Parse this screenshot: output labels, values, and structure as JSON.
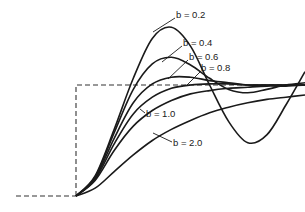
{
  "chart_data": {
    "type": "line",
    "title": "",
    "subtitle": "Unit step response of a second-order system for various damping ratios b",
    "xlabel": "",
    "ylabel": "",
    "grid": false,
    "legend_position": "inline leader-line labels",
    "input": {
      "name": "unit step",
      "style": "dashed",
      "baseline": 0,
      "level": 1.0
    },
    "x": [
      0,
      1,
      2,
      3,
      4,
      5,
      6,
      7,
      8,
      9,
      10,
      11,
      12
    ],
    "series": [
      {
        "name": "b = 0.2",
        "label": "b = 0.2",
        "values": [
          0,
          0.18,
          0.6,
          1.06,
          1.42,
          1.52,
          1.35,
          1.0,
          0.67,
          0.48,
          0.55,
          0.82,
          1.12
        ]
      },
      {
        "name": "b = 0.4",
        "label": "b = 0.4",
        "values": [
          0,
          0.17,
          0.57,
          0.96,
          1.19,
          1.25,
          1.18,
          1.06,
          0.96,
          0.93,
          0.96,
          1.0,
          1.02
        ]
      },
      {
        "name": "b = 0.6",
        "label": "b = 0.6",
        "values": [
          0,
          0.16,
          0.52,
          0.84,
          1.01,
          1.07,
          1.07,
          1.04,
          1.02,
          1.0,
          1.0,
          1.0,
          1.0
        ]
      },
      {
        "name": "b = 0.8",
        "label": "b = 0.8",
        "values": [
          0,
          0.15,
          0.47,
          0.74,
          0.89,
          0.97,
          1.0,
          1.01,
          1.01,
          1.0,
          1.0,
          1.0,
          1.0
        ]
      },
      {
        "name": "b = 1.0",
        "label": "b = 1.0",
        "values": [
          0,
          0.14,
          0.41,
          0.63,
          0.77,
          0.86,
          0.92,
          0.95,
          0.97,
          0.98,
          0.99,
          0.99,
          1.0
        ]
      },
      {
        "name": "b = 2.0",
        "label": "b = 2.0",
        "values": [
          0,
          0.07,
          0.22,
          0.37,
          0.5,
          0.6,
          0.68,
          0.75,
          0.8,
          0.84,
          0.87,
          0.89,
          0.91
        ]
      }
    ],
    "annotations": [
      "b = 0.2",
      "b = 0.4",
      "b = 0.6",
      "b = 0.8",
      "b = 1.0",
      "b = 2.0"
    ]
  },
  "labels": {
    "b02": "b = 0.2",
    "b04": "b = 0.4",
    "b06": "b = 0.6",
    "b08": "b = 0.8",
    "b10": "b = 1.0",
    "b20": "b = 2.0"
  },
  "colors": {
    "ink": "#1a1a1a",
    "background": "#ffffff"
  }
}
